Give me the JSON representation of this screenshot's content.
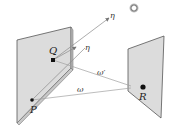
{
  "diagram": {
    "type": "geometry-light-transport",
    "colors": {
      "panel_fill": "#d9d9d9",
      "panel_edge": "#555555",
      "ray": "#888888",
      "point": "#111111",
      "ring": "#888888"
    },
    "points": [
      {
        "id": "Q",
        "label": "Q"
      },
      {
        "id": "P",
        "label": "P"
      },
      {
        "id": "R",
        "label": "R"
      }
    ],
    "rays": [
      {
        "id": "eta-outer",
        "label": "η"
      },
      {
        "id": "eta-inner",
        "label": "η"
      },
      {
        "id": "omega-prime",
        "label": "ω′"
      },
      {
        "id": "omega",
        "label": "ω"
      }
    ],
    "light_source": {
      "label": "ring-light"
    }
  }
}
